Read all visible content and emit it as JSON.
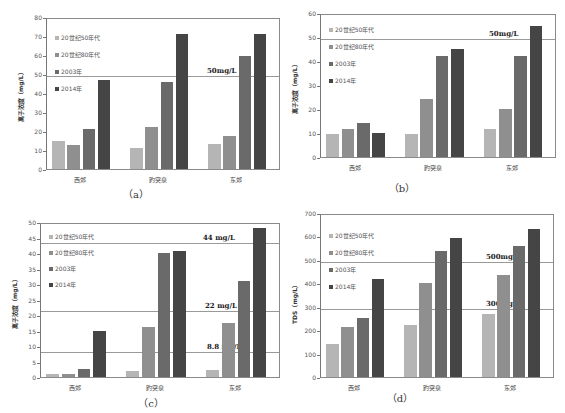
{
  "series_names": [
    "20世纪50年代",
    "20世纪80年代",
    "2003年",
    "2014年"
  ],
  "series_colors": [
    "#b5b5b5",
    "#8f8f8f",
    "#6a6a6a",
    "#454545"
  ],
  "categories": [
    "西郊",
    "趵突泉",
    "东郊"
  ],
  "chart_data": [
    {
      "type": "bar",
      "caption": "（a）",
      "ylabel": "离子浓度（mg/L）",
      "xlabel": "",
      "ylim": [
        0,
        80
      ],
      "yticks": [
        0,
        10,
        20,
        30,
        40,
        50,
        60,
        70,
        80
      ],
      "categories": [
        "西郊",
        "趵突泉",
        "东郊"
      ],
      "series": [
        {
          "name": "20世纪50年代",
          "values": [
            14.5,
            11,
            13
          ]
        },
        {
          "name": "20世纪80年代",
          "values": [
            12.5,
            22,
            17.5
          ]
        },
        {
          "name": "2003年",
          "values": [
            21,
            46,
            59.5
          ]
        },
        {
          "name": "2014年",
          "values": [
            47,
            71,
            71
          ]
        }
      ],
      "reference_lines": [
        {
          "value": 50,
          "label": "50mg/L"
        }
      ],
      "legend_position": "upper-left"
    },
    {
      "type": "bar",
      "caption": "（b）",
      "ylabel": "离子浓度（mg/L）",
      "xlabel": "",
      "ylim": [
        0,
        60
      ],
      "yticks": [
        0,
        10,
        20,
        30,
        40,
        50,
        60
      ],
      "categories": [
        "西郊",
        "趵突泉",
        "东郊"
      ],
      "series": [
        {
          "name": "20世纪50年代",
          "values": [
            9.5,
            9.5,
            11.5
          ]
        },
        {
          "name": "20世纪80年代",
          "values": [
            11.5,
            24,
            20
          ]
        },
        {
          "name": "2003年",
          "values": [
            14,
            42,
            42
          ]
        },
        {
          "name": "2014年",
          "values": [
            10,
            45,
            54.5
          ]
        }
      ],
      "reference_lines": [
        {
          "value": 50,
          "label": "50mg/L"
        }
      ],
      "legend_position": "upper-left"
    },
    {
      "type": "bar",
      "caption": "（c）",
      "ylabel": "离子浓度（mg/L）",
      "xlabel": "",
      "ylim": [
        0,
        50
      ],
      "yticks": [
        0,
        5,
        10,
        15,
        20,
        25,
        30,
        35,
        40,
        45,
        50
      ],
      "categories": [
        "西郊",
        "趵突泉",
        "东郊"
      ],
      "series": [
        {
          "name": "20世纪50年代",
          "values": [
            1,
            2,
            2.2
          ]
        },
        {
          "name": "20世纪80年代",
          "values": [
            1,
            16,
            17.5
          ]
        },
        {
          "name": "2003年",
          "values": [
            2.5,
            40,
            31
          ]
        },
        {
          "name": "2014年",
          "values": [
            15,
            40.5,
            48
          ]
        }
      ],
      "reference_lines": [
        {
          "value": 44,
          "label": "44  mg/L"
        },
        {
          "value": 22,
          "label": "22 mg/L"
        },
        {
          "value": 8.8,
          "label": "8.8 mg/L"
        }
      ],
      "legend_position": "upper-left"
    },
    {
      "type": "bar",
      "caption": "（d）",
      "ylabel": "TDS（mg/L）",
      "xlabel": "",
      "ylim": [
        0,
        700
      ],
      "yticks": [
        0,
        100,
        200,
        300,
        400,
        500,
        600,
        700
      ],
      "categories": [
        "西郊",
        "趵突泉",
        "东郊"
      ],
      "series": [
        {
          "name": "20世纪50年代",
          "values": [
            140,
            220,
            270
          ]
        },
        {
          "name": "20世纪80年代",
          "values": [
            215,
            400,
            435
          ]
        },
        {
          "name": "2003年",
          "values": [
            250,
            540,
            560
          ]
        },
        {
          "name": "2014年",
          "values": [
            420,
            595,
            630
          ]
        }
      ],
      "reference_lines": [
        {
          "value": 500,
          "label": "500mg/L"
        },
        {
          "value": 300,
          "label": "300mg/L"
        }
      ],
      "legend_position": "upper-left"
    }
  ]
}
